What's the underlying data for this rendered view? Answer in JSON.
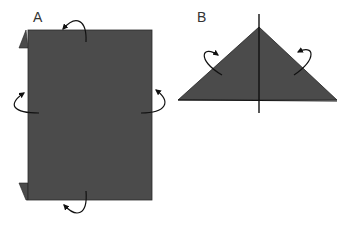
{
  "diagram": {
    "type": "origami-folding-steps",
    "colors": {
      "paper": "#4b4b4b",
      "line": "#111111",
      "background": "#ffffff"
    },
    "steps": [
      {
        "label": "A",
        "shape": "rectangle",
        "arrows": [
          "top-fold-under",
          "left-fold-under",
          "right-fold-under",
          "bottom-fold-under"
        ]
      },
      {
        "label": "B",
        "shape": "triangle",
        "arrows": [
          "left-fold-under",
          "right-fold-under"
        ],
        "center_line": true
      }
    ]
  }
}
